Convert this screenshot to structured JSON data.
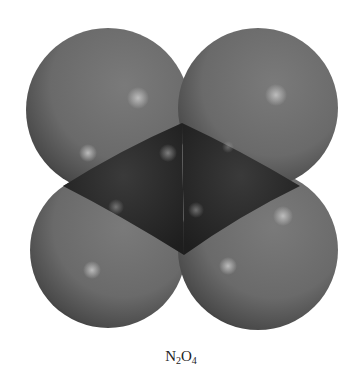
{
  "figure": {
    "type": "space-filling molecular model",
    "caption": {
      "parts": [
        {
          "text": "N",
          "sub": "2"
        },
        {
          "text": "O",
          "sub": "4"
        }
      ]
    },
    "atoms": {
      "oxygen_count": 4,
      "nitrogen_count": 2
    },
    "colors": {
      "oxygen": "#6e6e6e",
      "oxygen_shadow": "#2f2f2f",
      "nitrogen": "#2e2e2e",
      "highlight": "#b8b8b8",
      "background": "#ffffff"
    }
  }
}
